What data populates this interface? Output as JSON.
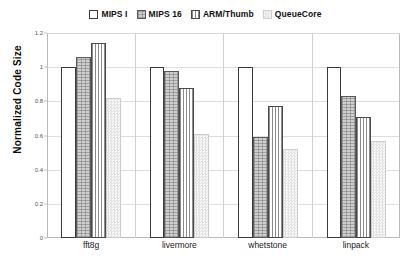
{
  "chart_data": {
    "type": "bar",
    "title": "",
    "xlabel": "",
    "ylabel": "Normalized Code Size",
    "ylim": [
      0,
      1.2
    ],
    "ytick_labels": [
      "0",
      "0.2",
      "0.4",
      "0.6",
      "0.8",
      "1",
      "1.2"
    ],
    "ytick_values": [
      0,
      0.2,
      0.4,
      0.6,
      0.8,
      1,
      1.2
    ],
    "grid": true,
    "legend_position": "top-center",
    "categories": [
      "fft8g",
      "livermore",
      "whetstone",
      "linpack"
    ],
    "series": [
      {
        "name": "MIPS I",
        "pattern": "outline",
        "values": [
          1.0,
          1.0,
          1.0,
          1.0
        ]
      },
      {
        "name": "MIPS 16",
        "pattern": "cross-hatch",
        "values": [
          1.06,
          0.98,
          0.59,
          0.83
        ]
      },
      {
        "name": "ARM/Thumb",
        "pattern": "vertical",
        "values": [
          1.14,
          0.88,
          0.77,
          0.71
        ]
      },
      {
        "name": "QueueCore",
        "pattern": "checker",
        "values": [
          0.82,
          0.61,
          0.52,
          0.57
        ]
      }
    ]
  },
  "legend": {
    "items": [
      {
        "label": "MIPS I"
      },
      {
        "label": "MIPS 16"
      },
      {
        "label": "ARM/Thumb"
      },
      {
        "label": "QueueCore"
      }
    ]
  },
  "colors": {
    "axis": "#b9b9b9",
    "grid": "#dedede",
    "text": "#111111",
    "mips1": "#ffffff",
    "mips16": "#cfcfcf",
    "arm": "#8c8c8c",
    "queuecore": "#e9e9e9"
  }
}
